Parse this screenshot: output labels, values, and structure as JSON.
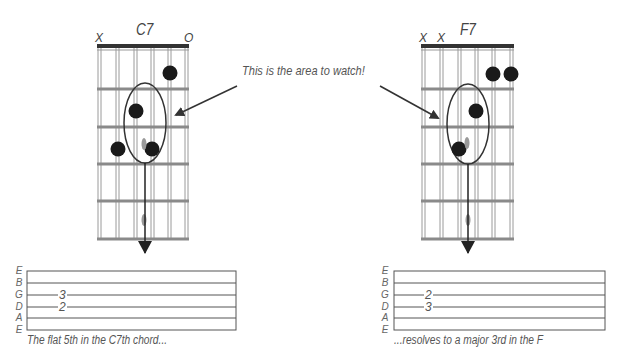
{
  "callout": {
    "text": "This is the area to watch!"
  },
  "chords": [
    {
      "name": "C7",
      "string_markers": [
        "X",
        "",
        "",
        "",
        "",
        "O"
      ],
      "dots": [
        {
          "string": 5,
          "fret": 1
        },
        {
          "string": 3,
          "fret": 2
        },
        {
          "string": 2,
          "fret": 3
        },
        {
          "string": 4,
          "fret": 3
        }
      ],
      "highlight_note": {
        "string": 3,
        "fret": 3
      },
      "tab": {
        "string_names": [
          "E",
          "B",
          "G",
          "D",
          "A",
          "E"
        ],
        "notes": [
          {
            "string": "G",
            "fret": "3"
          },
          {
            "string": "D",
            "fret": "2"
          }
        ]
      },
      "caption": "The flat 5th in the C7th chord..."
    },
    {
      "name": "F7",
      "string_markers": [
        "X",
        "X",
        "",
        "",
        "",
        ""
      ],
      "dots": [
        {
          "string": 5,
          "fret": 1
        },
        {
          "string": 6,
          "fret": 1
        },
        {
          "string": 4,
          "fret": 2
        },
        {
          "string": 3,
          "fret": 3
        }
      ],
      "highlight_note": {
        "string": 3,
        "fret": 3
      },
      "tab": {
        "string_names": [
          "E",
          "B",
          "G",
          "D",
          "A",
          "E"
        ],
        "notes": [
          {
            "string": "G",
            "fret": "2"
          },
          {
            "string": "D",
            "fret": "3"
          }
        ]
      },
      "caption": "...resolves to a major 3rd in the F"
    }
  ],
  "colors": {
    "fret_line": "#888888",
    "string_line": "#999999",
    "nut": "#333333",
    "dot": "#1a1a1a",
    "ellipse": "#333333",
    "arrow": "#333333",
    "text": "#555555"
  }
}
